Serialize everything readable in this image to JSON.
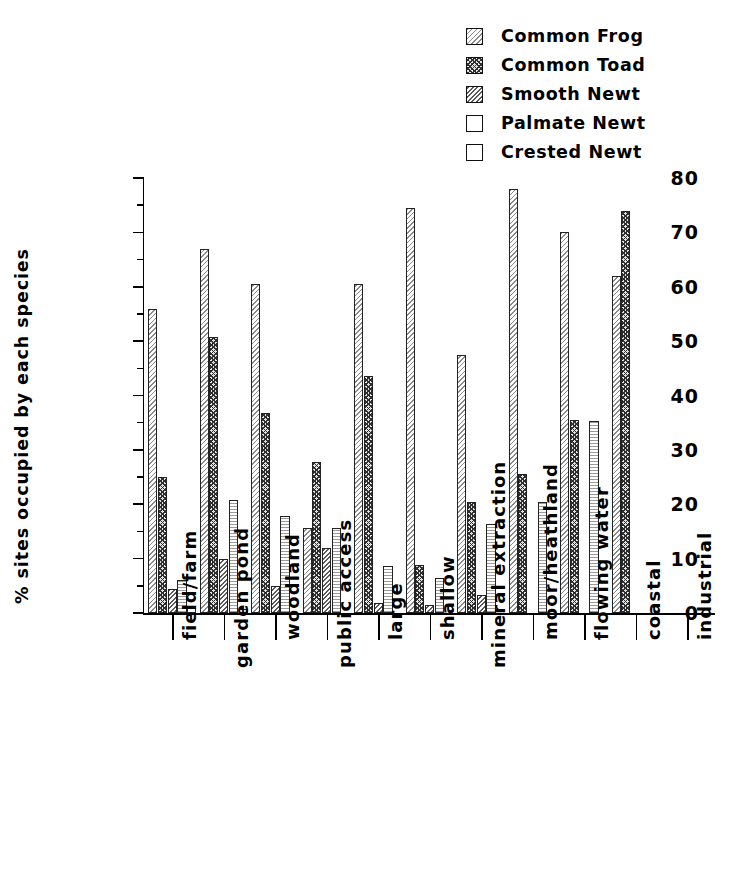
{
  "chart_data": {
    "type": "bar",
    "title": "",
    "xlabel": "",
    "ylabel": "% sites occupied by each species",
    "ylim": [
      0,
      80
    ],
    "ytick_labels": [
      "0",
      "10",
      "20",
      "30",
      "40",
      "50",
      "60",
      "70",
      "80"
    ],
    "ytick_values": [
      0,
      10,
      20,
      30,
      40,
      50,
      60,
      70,
      80
    ],
    "yminor_step": 5,
    "grid": false,
    "legend_position": "top-right",
    "categories": [
      "field/farm",
      "garden pond",
      "woodland",
      "public access",
      "large",
      "shallow",
      "mineral extraction",
      "moor/heathland",
      "flowing water",
      "coastal",
      "industrial"
    ],
    "series": [
      {
        "name": "Common Frog",
        "pattern": "light-diagonal-hatch",
        "values": [
          56,
          67,
          60.5,
          15.7,
          60.5,
          74.5,
          47.5,
          78,
          70,
          62,
          0
        ]
      },
      {
        "name": "Common Toad",
        "pattern": "dark-cross-hatch",
        "values": [
          25,
          50.8,
          36.8,
          27.7,
          43.5,
          8.8,
          20.5,
          25.5,
          35.5,
          74,
          0
        ]
      },
      {
        "name": "Smooth Newt",
        "pattern": "medium-diagonal-hatch",
        "values": [
          4.5,
          10,
          5,
          12,
          1.8,
          1.4,
          3.4,
          0,
          0,
          0,
          0
        ]
      },
      {
        "name": "Palmate Newt",
        "pattern": "horizontal-line-fill",
        "values": [
          6,
          20.7,
          17.8,
          15.7,
          8.7,
          6.5,
          16.4,
          20.4,
          35.4,
          0,
          0
        ]
      },
      {
        "name": "Crested Newt",
        "pattern": "blank",
        "values": [
          1,
          0.8,
          0,
          0,
          0,
          0,
          0,
          0,
          0,
          0,
          0
        ]
      }
    ]
  },
  "legend": {
    "items": [
      {
        "label": "Common Frog",
        "swatch": "pat-frog"
      },
      {
        "label": "Common Toad",
        "swatch": "pat-toad"
      },
      {
        "label": "Smooth Newt",
        "swatch": "pat-smooth"
      },
      {
        "label": "Palmate Newt",
        "swatch": "pat-palmate"
      },
      {
        "label": "Crested Newt",
        "swatch": "pat-crested"
      }
    ]
  }
}
